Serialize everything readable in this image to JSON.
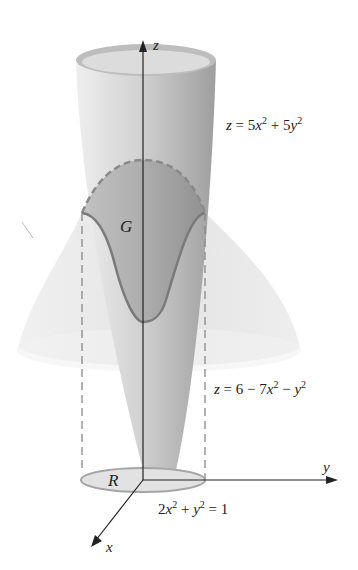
{
  "figure": {
    "axes": {
      "z_label": "z",
      "y_label": "y",
      "x_label": "x"
    },
    "region_labels": {
      "surface_region": "G",
      "base_region": "R"
    },
    "equations": {
      "upper_surface": {
        "lhs": "z",
        "parts": [
          "5x",
          "2",
          " + 5y",
          "2"
        ],
        "text": "z = 5x^2 + 5y^2"
      },
      "lower_surface": {
        "text": "z = 6 − 7x^2 − y^2"
      },
      "boundary_curve": {
        "text": "2x^2 + y^2 = 1"
      }
    },
    "colors": {
      "surface_light": "#e6e6e6",
      "surface_mid": "#c8c8c8",
      "surface_dark": "#9a9a9a",
      "curve": "#7a7a7a",
      "axis": "#222222"
    }
  }
}
